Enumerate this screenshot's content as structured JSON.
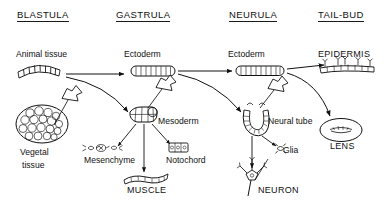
{
  "diagram": {
    "title_row": [
      {
        "id": "blastula",
        "label": "BLASTULA"
      },
      {
        "id": "gastrula",
        "label": "GASTRULA"
      },
      {
        "id": "neurula",
        "label": "NEURULA"
      },
      {
        "id": "tailbud",
        "label": "TAIL-BUD"
      }
    ],
    "germ_layer_row": [
      {
        "id": "animal-tissue",
        "label": "Animal tissue"
      },
      {
        "id": "ectoderm-gastrula",
        "label": "Ectoderm"
      },
      {
        "id": "ectoderm-neurula",
        "label": "Ectoderm"
      },
      {
        "id": "epidermis",
        "label": "EPIDERMIS"
      }
    ],
    "lower_labels": [
      {
        "id": "vegetal-tissue-line1",
        "label": "Vegetal"
      },
      {
        "id": "vegetal-tissue-line2",
        "label": "tissue"
      },
      {
        "id": "mesoderm",
        "label": "Mesoderm"
      },
      {
        "id": "neural-tube",
        "label": "Neural tube"
      },
      {
        "id": "lens",
        "label": "LENS"
      }
    ],
    "derivatives": [
      {
        "id": "mesenchyme",
        "label": "Mesenchyme"
      },
      {
        "id": "notochord",
        "label": "Notochord"
      },
      {
        "id": "muscle",
        "label": "MUSCLE"
      },
      {
        "id": "glia",
        "label": "Glia"
      },
      {
        "id": "neuron",
        "label": "NEURON"
      }
    ],
    "colors": {
      "ink": "#111111",
      "background": "#ffffff",
      "rule": "#1a1a1a"
    }
  }
}
